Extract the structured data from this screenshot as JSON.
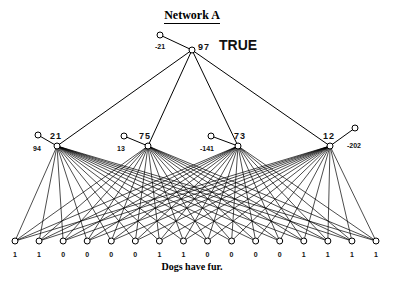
{
  "title": "Network A",
  "output_node": {
    "label": "TRUE",
    "activation": "97",
    "bias": "-21"
  },
  "hidden_nodes": [
    {
      "activation": "21",
      "bias": "94"
    },
    {
      "activation": "75",
      "bias": "13"
    },
    {
      "activation": "73",
      "bias": "-141"
    },
    {
      "activation": "12",
      "bias": "-202"
    }
  ],
  "input_values": [
    "1",
    "1",
    "0",
    "0",
    "0",
    "0",
    "1",
    "1",
    "0",
    "0",
    "0",
    "0",
    "1",
    "1",
    "1",
    "1"
  ],
  "caption": "Dogs have fur."
}
